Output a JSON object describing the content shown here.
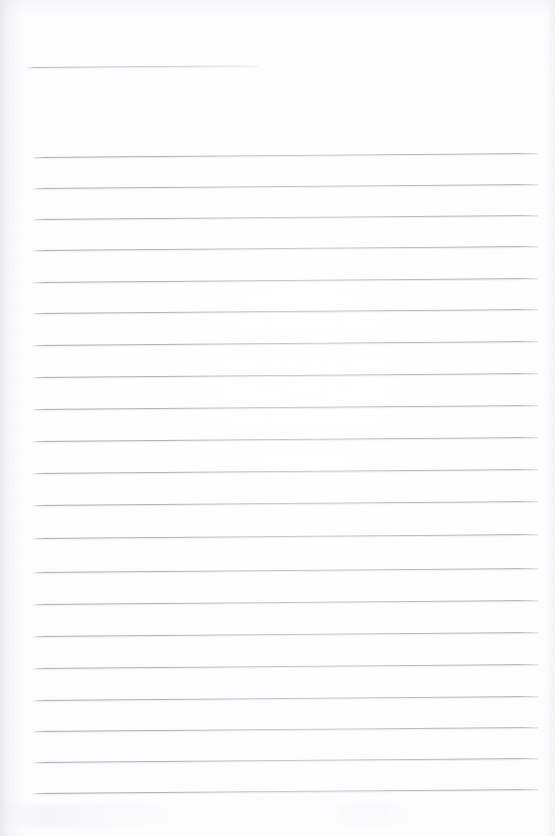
{
  "document": {
    "kind": "scanned-page",
    "title": "Blank lined notebook page",
    "page_width": 555,
    "page_height": 836,
    "background_color": "#fdfdfd",
    "rule_color": "#a8a8b0",
    "content_text": "",
    "visible_text": []
  },
  "ruling": {
    "style": "single-ruled-horizontal-lines",
    "line_count": 22,
    "line_spacing_px": 31.3,
    "line_thickness_px": 1,
    "left_margin_px": 33,
    "right_margin_px": 538,
    "slant_degrees": -0.45,
    "first_line_is_short": true,
    "short_line_end_px": 258
  },
  "lines": [
    {
      "id": "rule-0",
      "y": 67,
      "x_start": 28,
      "x_end": 258,
      "short": true
    },
    {
      "id": "rule-1",
      "y": 157,
      "x_start": 33,
      "x_end": 538,
      "short": false
    },
    {
      "id": "rule-2",
      "y": 188,
      "x_start": 33,
      "x_end": 538,
      "short": false
    },
    {
      "id": "rule-3",
      "y": 219,
      "x_start": 33,
      "x_end": 538,
      "short": false
    },
    {
      "id": "rule-4",
      "y": 250,
      "x_start": 33,
      "x_end": 538,
      "short": false
    },
    {
      "id": "rule-5",
      "y": 282,
      "x_start": 33,
      "x_end": 538,
      "short": false
    },
    {
      "id": "rule-6",
      "y": 313,
      "x_start": 33,
      "x_end": 538,
      "short": false
    },
    {
      "id": "rule-7",
      "y": 345,
      "x_start": 33,
      "x_end": 538,
      "short": false
    },
    {
      "id": "rule-8",
      "y": 377,
      "x_start": 33,
      "x_end": 538,
      "short": false
    },
    {
      "id": "rule-9",
      "y": 409,
      "x_start": 33,
      "x_end": 538,
      "short": false
    },
    {
      "id": "rule-10",
      "y": 441,
      "x_start": 33,
      "x_end": 538,
      "short": false
    },
    {
      "id": "rule-11",
      "y": 473,
      "x_start": 33,
      "x_end": 538,
      "short": false
    },
    {
      "id": "rule-12",
      "y": 505,
      "x_start": 33,
      "x_end": 538,
      "short": false
    },
    {
      "id": "rule-13",
      "y": 538,
      "x_start": 33,
      "x_end": 538,
      "short": false
    },
    {
      "id": "rule-14",
      "y": 572,
      "x_start": 33,
      "x_end": 538,
      "short": false
    },
    {
      "id": "rule-15",
      "y": 604,
      "x_start": 33,
      "x_end": 538,
      "short": false
    },
    {
      "id": "rule-16",
      "y": 636,
      "x_start": 33,
      "x_end": 538,
      "short": false
    },
    {
      "id": "rule-17",
      "y": 668,
      "x_start": 33,
      "x_end": 538,
      "short": false
    },
    {
      "id": "rule-18",
      "y": 700,
      "x_start": 33,
      "x_end": 538,
      "short": false
    },
    {
      "id": "rule-19",
      "y": 731,
      "x_start": 33,
      "x_end": 538,
      "short": false
    },
    {
      "id": "rule-20",
      "y": 762,
      "x_start": 33,
      "x_end": 538,
      "short": false
    },
    {
      "id": "rule-21",
      "y": 793,
      "x_start": 33,
      "x_end": 538,
      "short": false
    }
  ]
}
